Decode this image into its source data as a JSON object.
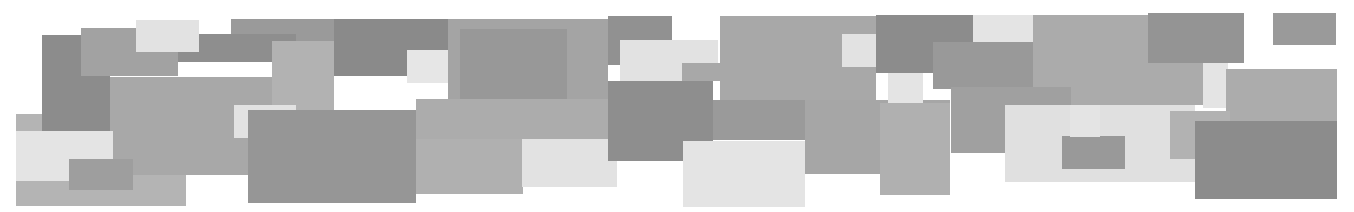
{
  "canvas": {
    "width": 1354,
    "height": 212,
    "background": "#ffffff"
  },
  "shapes": [
    {
      "x": 16,
      "y": 114,
      "w": 170,
      "h": 92,
      "color": "#b4b4b4"
    },
    {
      "x": 42,
      "y": 35,
      "w": 68,
      "h": 97,
      "color": "#8c8c8c"
    },
    {
      "x": 81,
      "y": 28,
      "w": 97,
      "h": 48,
      "color": "#a2a2a2"
    },
    {
      "x": 231,
      "y": 19,
      "w": 217,
      "h": 43,
      "color": "#9a9a9a"
    },
    {
      "x": 110,
      "y": 77,
      "w": 163,
      "h": 98,
      "color": "#a8a8a8"
    },
    {
      "x": 178,
      "y": 34,
      "w": 118,
      "h": 28,
      "color": "#8e8e8e"
    },
    {
      "x": 272,
      "y": 41,
      "w": 62,
      "h": 70,
      "color": "#b2b2b2"
    },
    {
      "x": 334,
      "y": 19,
      "w": 114,
      "h": 57,
      "color": "#8a8a8a"
    },
    {
      "x": 136,
      "y": 20,
      "w": 63,
      "h": 32,
      "color": "#e2e2e2"
    },
    {
      "x": 16,
      "y": 131,
      "w": 97,
      "h": 50,
      "color": "#e4e4e4"
    },
    {
      "x": 69,
      "y": 159,
      "w": 64,
      "h": 31,
      "color": "#9e9e9e"
    },
    {
      "x": 234,
      "y": 105,
      "w": 62,
      "h": 33,
      "color": "#e2e2e2"
    },
    {
      "x": 248,
      "y": 110,
      "w": 168,
      "h": 93,
      "color": "#969696"
    },
    {
      "x": 407,
      "y": 50,
      "w": 64,
      "h": 33,
      "color": "#e6e6e6"
    },
    {
      "x": 448,
      "y": 19,
      "w": 160,
      "h": 80,
      "color": "#a4a4a4"
    },
    {
      "x": 460,
      "y": 29,
      "w": 107,
      "h": 70,
      "color": "#989898"
    },
    {
      "x": 416,
      "y": 99,
      "w": 194,
      "h": 40,
      "color": "#acacac"
    },
    {
      "x": 416,
      "y": 139,
      "w": 107,
      "h": 55,
      "color": "#b0b0b0"
    },
    {
      "x": 522,
      "y": 139,
      "w": 95,
      "h": 48,
      "color": "#e2e2e2"
    },
    {
      "x": 608,
      "y": 16,
      "w": 64,
      "h": 49,
      "color": "#919191"
    },
    {
      "x": 620,
      "y": 40,
      "w": 98,
      "h": 41,
      "color": "#e2e2e2"
    },
    {
      "x": 682,
      "y": 63,
      "w": 40,
      "h": 18,
      "color": "#a8a8a8"
    },
    {
      "x": 608,
      "y": 81,
      "w": 105,
      "h": 80,
      "color": "#8e8e8e"
    },
    {
      "x": 713,
      "y": 100,
      "w": 170,
      "h": 40,
      "color": "#9a9a9a"
    },
    {
      "x": 720,
      "y": 16,
      "w": 156,
      "h": 84,
      "color": "#a8a8a8"
    },
    {
      "x": 842,
      "y": 34,
      "w": 63,
      "h": 33,
      "color": "#e2e2e2"
    },
    {
      "x": 876,
      "y": 15,
      "w": 97,
      "h": 58,
      "color": "#8c8c8c"
    },
    {
      "x": 683,
      "y": 141,
      "w": 122,
      "h": 66,
      "color": "#e4e4e4"
    },
    {
      "x": 805,
      "y": 100,
      "w": 145,
      "h": 74,
      "color": "#a6a6a6"
    },
    {
      "x": 973,
      "y": 15,
      "w": 60,
      "h": 27,
      "color": "#e4e4e4"
    },
    {
      "x": 933,
      "y": 42,
      "w": 100,
      "h": 47,
      "color": "#999999"
    },
    {
      "x": 1033,
      "y": 15,
      "w": 170,
      "h": 90,
      "color": "#ababab"
    },
    {
      "x": 888,
      "y": 73,
      "w": 35,
      "h": 30,
      "color": "#e4e4e4"
    },
    {
      "x": 880,
      "y": 103,
      "w": 70,
      "h": 92,
      "color": "#b0b0b0"
    },
    {
      "x": 951,
      "y": 87,
      "w": 120,
      "h": 66,
      "color": "#a0a0a0"
    },
    {
      "x": 1005,
      "y": 105,
      "w": 190,
      "h": 77,
      "color": "#e0e0e0"
    },
    {
      "x": 1148,
      "y": 13,
      "w": 96,
      "h": 50,
      "color": "#949494"
    },
    {
      "x": 1203,
      "y": 63,
      "w": 25,
      "h": 45,
      "color": "#e4e4e4"
    },
    {
      "x": 1062,
      "y": 136,
      "w": 63,
      "h": 33,
      "color": "#999999"
    },
    {
      "x": 1070,
      "y": 105,
      "w": 30,
      "h": 32,
      "color": "#e4e4e4"
    },
    {
      "x": 1226,
      "y": 69,
      "w": 111,
      "h": 52,
      "color": "#acacac"
    },
    {
      "x": 1170,
      "y": 111,
      "w": 60,
      "h": 48,
      "color": "#b2b2b2"
    },
    {
      "x": 1195,
      "y": 121,
      "w": 142,
      "h": 78,
      "color": "#8c8c8c"
    },
    {
      "x": 1273,
      "y": 13,
      "w": 63,
      "h": 32,
      "color": "#9a9a9a"
    }
  ]
}
